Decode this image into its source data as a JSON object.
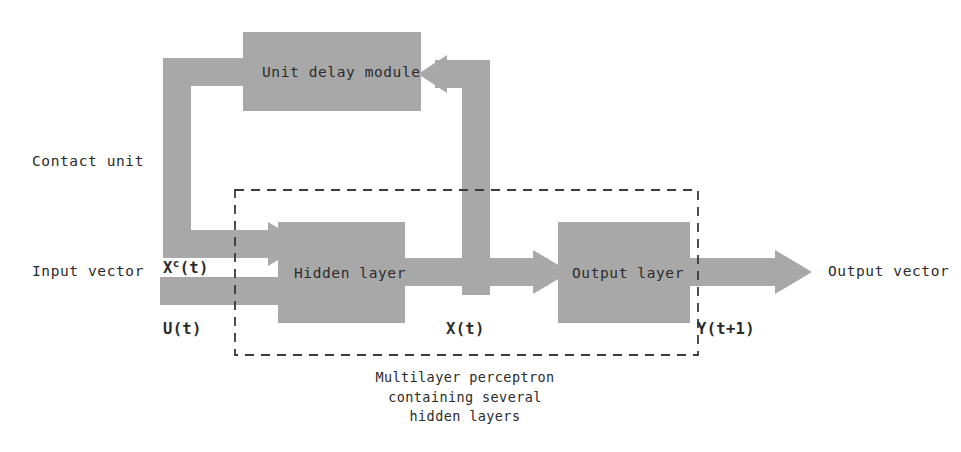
{
  "figure": {
    "type": "block-diagram",
    "background_color": "#ffffff",
    "block_fill_color": "#a8a8a8",
    "text_color": "#2b2b2b",
    "dashed_border_color": "#3a3a3a"
  },
  "blocks": {
    "delay_module": {
      "label": "Unit delay module"
    },
    "hidden_layer": {
      "label": "Hidden layer"
    },
    "output_layer": {
      "label": "Output layer"
    }
  },
  "labels": {
    "contact_unit": "Contact unit",
    "input_vector": "Input vector",
    "output_vector": "Output vector"
  },
  "signals": {
    "context_state_x": "X",
    "context_state_sup": "c",
    "context_state_t": "(t)",
    "input_u": "U(t)",
    "hidden_state": "X(t)",
    "output_y": "Y(t+1)"
  },
  "caption": {
    "line1": "Multilayer perceptron",
    "line2": "containing several",
    "line3": "hidden layers"
  }
}
